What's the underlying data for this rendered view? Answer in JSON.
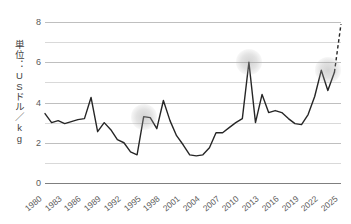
{
  "chart_data": {
    "type": "line",
    "title": "",
    "xlabel": "",
    "ylabel": "単位：USドル／kg",
    "ylim": [
      0,
      8
    ],
    "xlim": [
      1980,
      2025
    ],
    "grid": true,
    "legend": "none",
    "y_ticks": [
      0,
      2,
      4,
      6,
      8
    ],
    "y_tick_labels": [
      "0",
      "2",
      "4",
      "6",
      "8"
    ],
    "y_gridlines": [
      0,
      1,
      2,
      3,
      4,
      5,
      6,
      7,
      8
    ],
    "x_tick_labels": [
      "1980",
      "1983",
      "1986",
      "1989",
      "1992",
      "1995",
      "1998",
      "2001",
      "2004",
      "2007",
      "2010",
      "2013",
      "2016",
      "2019",
      "2022",
      "2025"
    ],
    "x": [
      1980,
      1981,
      1982,
      1983,
      1984,
      1985,
      1986,
      1987,
      1988,
      1989,
      1990,
      1991,
      1992,
      1993,
      1994,
      1995,
      1996,
      1997,
      1998,
      1999,
      2000,
      2001,
      2002,
      2003,
      2004,
      2005,
      2006,
      2007,
      2008,
      2009,
      2010,
      2011,
      2012,
      2013,
      2014,
      2015,
      2016,
      2017,
      2018,
      2019,
      2020,
      2021,
      2022,
      2023,
      2024,
      2025
    ],
    "values": [
      3.45,
      3.0,
      3.1,
      2.95,
      3.05,
      3.15,
      3.2,
      4.25,
      2.55,
      3.0,
      2.65,
      2.15,
      2.0,
      1.55,
      1.4,
      3.3,
      3.25,
      2.7,
      4.1,
      3.1,
      2.35,
      1.9,
      1.4,
      1.35,
      1.4,
      1.75,
      2.5,
      2.5,
      2.75,
      3.0,
      3.2,
      6.0,
      3.0,
      4.4,
      3.5,
      3.6,
      3.5,
      3.2,
      2.95,
      2.9,
      3.4,
      4.3,
      5.6,
      4.6,
      5.5,
      7.9
    ],
    "forecast_from": 2024,
    "forecast_note": "final segment drawn as dashed line",
    "highlights": [
      {
        "x": 1995,
        "y": 3.3
      },
      {
        "x": 2011,
        "y": 6.0
      },
      {
        "x": 2023,
        "y": 5.6
      }
    ],
    "colors": {
      "line": "#262626",
      "gridline": "#d9d9d9",
      "baseline": "#7f7f7f",
      "text": "#595959",
      "highlight": "#a6a6a6",
      "background": "#ffffff"
    }
  }
}
